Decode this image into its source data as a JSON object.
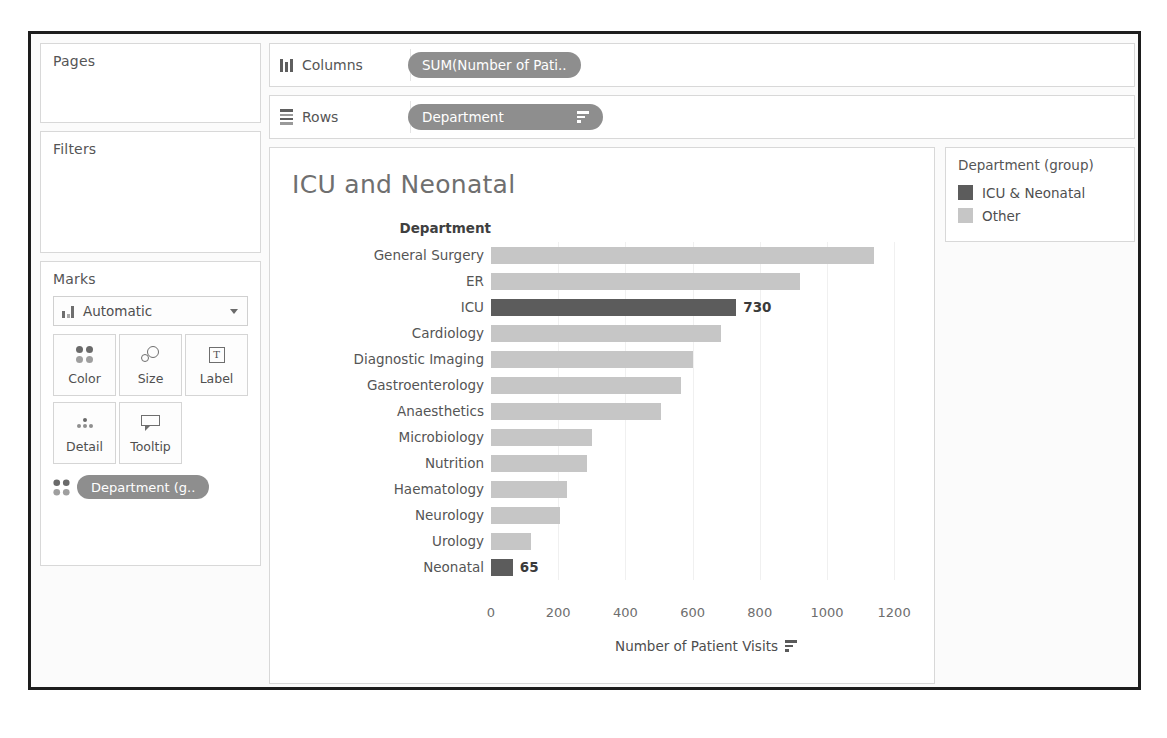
{
  "shelves": {
    "pages": {
      "title": "Pages"
    },
    "filters": {
      "title": "Filters"
    },
    "marks": {
      "title": "Marks",
      "mark_type": "Automatic",
      "buttons": [
        {
          "label": "Color",
          "icon": "color-icon"
        },
        {
          "label": "Size",
          "icon": "size-icon"
        },
        {
          "label": "Label",
          "icon": "label-icon"
        },
        {
          "label": "Detail",
          "icon": "detail-icon"
        },
        {
          "label": "Tooltip",
          "icon": "tooltip-icon"
        }
      ],
      "pill": "Department (g.."
    },
    "columns": {
      "name": "Columns",
      "pill": "SUM(Number of Pati.."
    },
    "rows": {
      "name": "Rows",
      "pill": "Department"
    }
  },
  "legend": {
    "title": "Department (group)",
    "items": [
      {
        "label": "ICU & Neonatal",
        "color": "#5c5c5c"
      },
      {
        "label": "Other",
        "color": "#c6c6c6"
      }
    ]
  },
  "chart_data": {
    "type": "bar",
    "title": "ICU and Neonatal",
    "orientation": "horizontal",
    "row_header": "Department",
    "xlabel": "Number of Patient Visits",
    "ylabel": "Department",
    "xlim": [
      0,
      1280
    ],
    "xticks": [
      0,
      200,
      400,
      600,
      800,
      1000,
      1200
    ],
    "grid": true,
    "legend_position": "right",
    "categories": [
      "General Surgery",
      "ER",
      "ICU",
      "Cardiology",
      "Diagnostic Imaging",
      "Gastroenterology",
      "Anaesthetics",
      "Microbiology",
      "Nutrition",
      "Haematology",
      "Neurology",
      "Urology",
      "Neonatal"
    ],
    "values": [
      1140,
      920,
      730,
      685,
      600,
      565,
      505,
      300,
      285,
      225,
      205,
      120,
      65
    ],
    "groups": [
      "Other",
      "Other",
      "ICU & Neonatal",
      "Other",
      "Other",
      "Other",
      "Other",
      "Other",
      "Other",
      "Other",
      "Other",
      "Other",
      "ICU & Neonatal"
    ],
    "data_labels": [
      "",
      "",
      "730",
      "",
      "",
      "",
      "",
      "",
      "",
      "",
      "",
      "",
      "65"
    ],
    "colors": {
      "highlight": "#5c5c5c",
      "other": "#c6c6c6"
    }
  }
}
